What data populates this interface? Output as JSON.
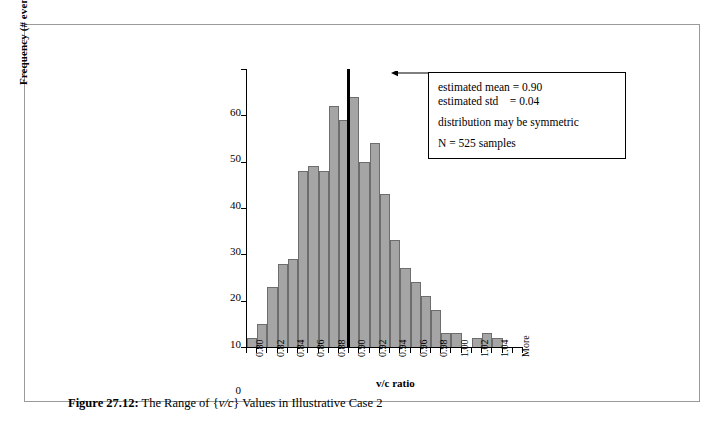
{
  "figure": {
    "caption_label": "Figure 27.12:",
    "caption_text": "The Range of {v/c} Values in Illustrative Case 2",
    "caption_italic": "v/c",
    "caption_prefix": "The Range of {",
    "caption_suffix": "} Values in Illustrative Case 2"
  },
  "annotation": {
    "line1": "estimated mean = 0.90",
    "line2": "estimated std    = 0.04",
    "line3": "distribution may be symmetric",
    "line4": "N = 525 samples"
  },
  "chart_data": {
    "type": "bar",
    "title": "",
    "xlabel": "v/c ratio",
    "ylabel": "Frequency (# events)",
    "ylim": [
      0,
      60
    ],
    "ytick_labels": [
      "0",
      "10",
      "20",
      "30",
      "40",
      "50",
      "60"
    ],
    "ytick_values": [
      0,
      10,
      20,
      30,
      40,
      50,
      60
    ],
    "grid": false,
    "legend": "none",
    "categories": [
      "0.80",
      "0.81",
      "0.82",
      "0.83",
      "0.84",
      "0.85",
      "0.86",
      "0.87",
      "0.88",
      "0.89",
      "0.90",
      "0.91",
      "0.92",
      "0.93",
      "0.94",
      "0.95",
      "0.96",
      "0.97",
      "0.98",
      "0.99",
      "1.00",
      "1.01",
      "1.02",
      "1.03",
      "1.04",
      "1.05",
      "More"
    ],
    "xtick_labels_shown": [
      "0.80",
      "0.82",
      "0.84",
      "0.86",
      "0.88",
      "0.90",
      "0.92",
      "0.94",
      "0.96",
      "0.98",
      "1.00",
      "1.02",
      "1.04",
      "More"
    ],
    "values": [
      2,
      5,
      13,
      18,
      19,
      38,
      39,
      38,
      52,
      49,
      54,
      40,
      44,
      33,
      23,
      17,
      14,
      11,
      8,
      3,
      3,
      0,
      2,
      3,
      2,
      0,
      0
    ],
    "annotations": [
      {
        "type": "vline",
        "x": "0.90",
        "label": "estimated mean",
        "value": 0.9,
        "color": "#000000"
      },
      {
        "type": "arrow",
        "from": "annotation-box",
        "to": "mean-line"
      }
    ],
    "colors": {
      "bar_fill": "#a5a5a5",
      "bar_edge": "#6d6d6d",
      "axis": "#000000",
      "mean_line": "#000000",
      "frame": "#9a9a9a",
      "background": "#ffffff"
    }
  }
}
